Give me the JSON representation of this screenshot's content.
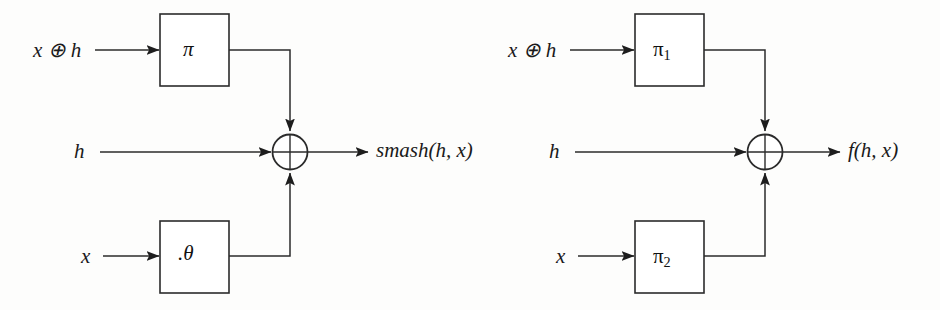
{
  "figure": {
    "type": "block-diagram",
    "background_color": "#fdfdfc",
    "line_color": "#2b2b2b"
  },
  "diagrams": [
    {
      "id": "left",
      "name": "smash-construction",
      "inputs": [
        {
          "name": "top-input",
          "label_plain": "x ⊕ h",
          "label_parts": {
            "var1": "x",
            "operator": "⊕",
            "var2": "h"
          }
        },
        {
          "name": "middle-input",
          "label_plain": "h"
        },
        {
          "name": "bottom-input",
          "label_plain": "x"
        }
      ],
      "blocks": [
        {
          "name": "top-block",
          "label_plain": "π",
          "label_base": "π",
          "label_sub": ""
        },
        {
          "name": "bottom-block",
          "label_plain": ".θ",
          "label_base": "θ",
          "label_prefix": "·"
        }
      ],
      "operator": {
        "name": "xor-node",
        "symbol": "⊕"
      },
      "output": {
        "name": "output-label",
        "label_plain": "smash(h, x)",
        "function": "smash",
        "args": "h, x"
      }
    },
    {
      "id": "right",
      "name": "f-construction",
      "inputs": [
        {
          "name": "top-input",
          "label_plain": "x ⊕ h",
          "label_parts": {
            "var1": "x",
            "operator": "⊕",
            "var2": "h"
          }
        },
        {
          "name": "middle-input",
          "label_plain": "h"
        },
        {
          "name": "bottom-input",
          "label_plain": "x"
        }
      ],
      "blocks": [
        {
          "name": "top-block",
          "label_plain": "π1",
          "label_base": "π",
          "label_sub": "1"
        },
        {
          "name": "bottom-block",
          "label_plain": "π2",
          "label_base": "π",
          "label_sub": "2"
        }
      ],
      "operator": {
        "name": "xor-node",
        "symbol": "⊕"
      },
      "output": {
        "name": "output-label",
        "label_plain": "f(h, x)",
        "function": "f",
        "args": "h, x"
      }
    }
  ]
}
